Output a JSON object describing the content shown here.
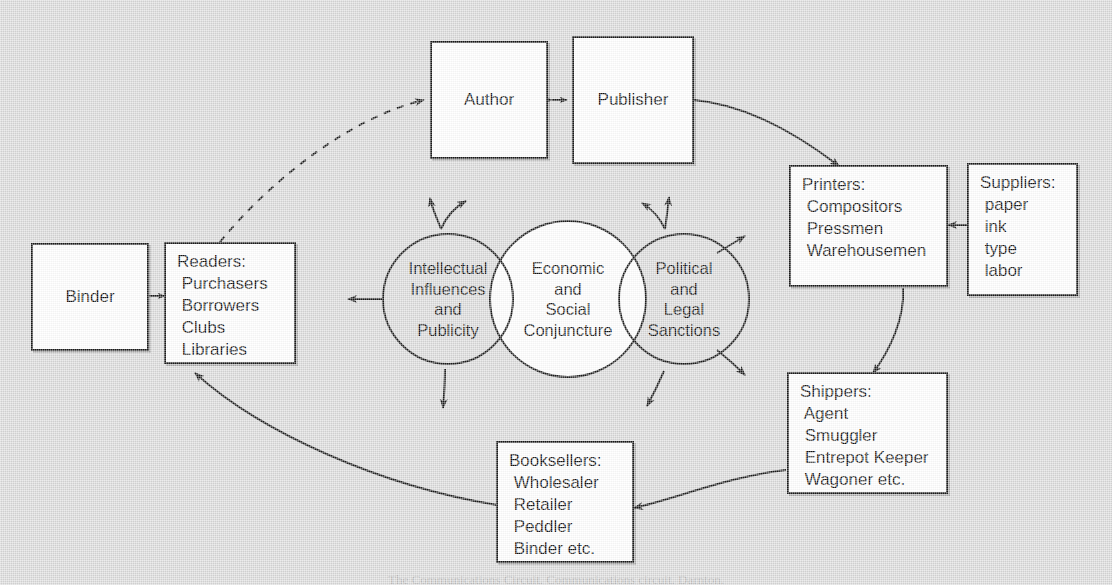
{
  "figure": {
    "background_color": "#d9d9d9",
    "line_color": "#1a1a1a",
    "node_fill": "#ffffff",
    "caption": "The Communications Circuit. Communications circuit. Darnton."
  },
  "nodes": {
    "author": {
      "label": "Author"
    },
    "publisher": {
      "label": "Publisher"
    },
    "printers": {
      "label": "Printers:\n Compositors\n Pressmen\n Warehousemen"
    },
    "suppliers": {
      "label": "Suppliers:\n paper\n ink\n type\n labor"
    },
    "shippers": {
      "label": "Shippers:\n Agent\n Smuggler\n Entrepot Keeper\n Wagoner etc."
    },
    "booksellers": {
      "label": "Booksellers:\n Wholesaler\n Retailer\n Peddler\n Binder etc."
    },
    "readers": {
      "label": "Readers:\n Purchasers\n Borrowers\n Clubs\n Libraries"
    },
    "binder": {
      "label": "Binder"
    }
  },
  "circles": {
    "left": {
      "label": "Intellectual\nInfluences\nand\nPublicity",
      "fill": "none"
    },
    "center": {
      "label": "Economic\nand\nSocial\nConjuncture",
      "fill": "#ffffff"
    },
    "right": {
      "label": "Political\nand\nLegal\nSanctions",
      "fill": "none"
    }
  },
  "connections": [
    {
      "name": "author-publisher",
      "from": "author",
      "to": "publisher",
      "style": "solid",
      "arrows": "both"
    },
    {
      "name": "publisher-printers",
      "from": "publisher",
      "to": "printers",
      "style": "solid",
      "arrows": "end"
    },
    {
      "name": "suppliers-printers",
      "from": "suppliers",
      "to": "printers",
      "style": "solid",
      "arrows": "end"
    },
    {
      "name": "printers-shippers",
      "from": "printers",
      "to": "shippers",
      "style": "solid",
      "arrows": "end"
    },
    {
      "name": "shippers-booksellers",
      "from": "shippers",
      "to": "booksellers",
      "style": "solid",
      "arrows": "end"
    },
    {
      "name": "booksellers-readers",
      "from": "booksellers",
      "to": "readers",
      "style": "solid",
      "arrows": "end"
    },
    {
      "name": "readers-author",
      "from": "readers",
      "to": "author",
      "style": "dashed",
      "arrows": "end"
    },
    {
      "name": "binder-readers",
      "from": "binder",
      "to": "readers",
      "style": "solid",
      "arrows": "both"
    },
    {
      "name": "influences-readers",
      "from": "left-circle",
      "to": "readers",
      "style": "solid",
      "arrows": "end"
    }
  ]
}
